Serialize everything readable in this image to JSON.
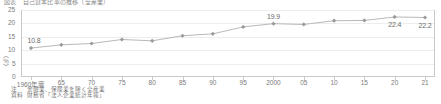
{
  "figure": {
    "title": "図表　自己資本比率の推移（全産業）",
    "y_axis_label": "（％）",
    "notes": [
      {
        "key": "注",
        "text": "金融業、保険業を除く全産業"
      },
      {
        "key": "資料",
        "text": "財務省「法人企業統計年報」"
      }
    ],
    "colors": {
      "line": "#b9b9b9",
      "marker": "#9a9a9a",
      "frame": "#c9c9c9",
      "grid": "#ededed",
      "text": "#7a7a7a"
    }
  },
  "chart_data": {
    "type": "line",
    "title": "図表　自己資本比率の推移（全産業）",
    "xlabel": "",
    "ylabel": "（％）",
    "ylim": [
      0,
      25
    ],
    "yticks": [
      0,
      5,
      10,
      15,
      20,
      25
    ],
    "grid": true,
    "legend": "none",
    "categories": [
      "1960年度",
      "65",
      "70",
      "75",
      "80",
      "85",
      "90",
      "95",
      "2000",
      "05",
      "10",
      "15",
      "20",
      "21"
    ],
    "values": [
      10.8,
      12.0,
      12.5,
      14.0,
      13.5,
      15.4,
      16.1,
      18.7,
      19.9,
      19.6,
      21.0,
      21.1,
      22.4,
      22.2
    ],
    "point_labels": [
      {
        "category": "1960年度",
        "value": 10.8,
        "label": "10.8"
      },
      {
        "category": "2000",
        "value": 19.9,
        "label": "19.9"
      },
      {
        "category": "20",
        "value": 22.4,
        "label": "22.4"
      },
      {
        "category": "21",
        "value": 22.2,
        "label": "22.2"
      }
    ]
  }
}
